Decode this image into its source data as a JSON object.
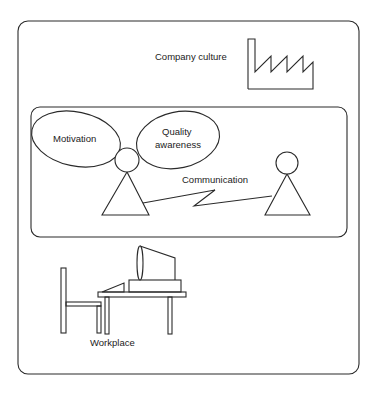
{
  "diagram": {
    "outer_frame": {
      "label": "Company culture",
      "icon": "factory-icon"
    },
    "inner_frame": {
      "left_person": {
        "bubbles": [
          {
            "label": "Motivation"
          },
          {
            "label_line1": "Quality",
            "label_line2": "awareness"
          }
        ]
      },
      "link_label": "Communication",
      "link_icon": "lightning-bolt-icon"
    },
    "workplace": {
      "label": "Workplace",
      "icons": [
        "chair-icon",
        "desk-icon",
        "computer-monitor-icon",
        "keyboard-icon"
      ]
    }
  },
  "colors": {
    "line": "#2a2a2a",
    "background": "#ffffff",
    "text": "#222222"
  }
}
